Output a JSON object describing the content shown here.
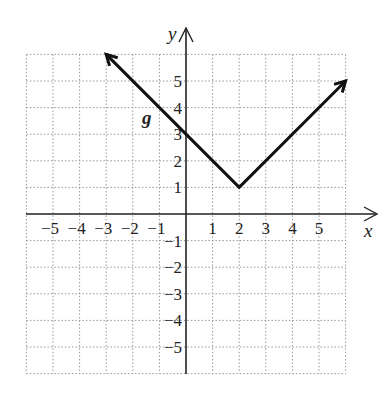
{
  "chart_data": {
    "type": "line",
    "title": "",
    "xlabel": "x",
    "ylabel": "y",
    "function_label": "g",
    "xlim": [
      -6,
      6
    ],
    "ylim": [
      -6,
      6
    ],
    "grid": true,
    "grid_style": "dotted",
    "x_ticks": [
      "-5",
      "-4",
      "-3",
      "-2",
      "-1",
      "1",
      "2",
      "3",
      "4",
      "5"
    ],
    "y_ticks": [
      "5",
      "4",
      "3",
      "2",
      "1",
      "-1",
      "-2",
      "-3",
      "-4",
      "-5"
    ],
    "series": [
      {
        "name": "g",
        "points": [
          [
            -3,
            6
          ],
          [
            2,
            1
          ],
          [
            6,
            5
          ]
        ],
        "vertex": [
          2,
          1
        ],
        "y_intercept": 3,
        "arrows_both_ends": true
      }
    ],
    "colors": {
      "line": "#111111",
      "grid": "#999999",
      "axis": "#222222"
    }
  }
}
